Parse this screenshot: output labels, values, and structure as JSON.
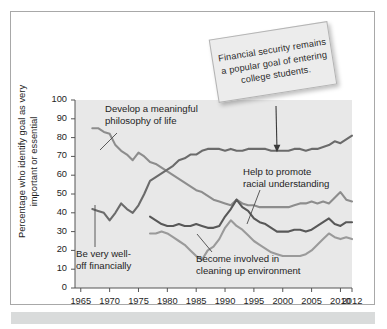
{
  "figure": {
    "background": "#ffffff",
    "frame_color": "#a8a8a8",
    "footer_bar_color": "#d9dbdb"
  },
  "callout": {
    "name": "financial-security-callout",
    "text": "Financial security remains a popular goal of entering college students.",
    "background": "#ececec",
    "border": "#b4b4b4",
    "rotation_deg": -9,
    "arrow_target_year": 1999,
    "arrow_target_value": 72
  },
  "annotations": [
    {
      "id": "philosophy",
      "text": "Develop a meaningful\nphilosophy of life"
    },
    {
      "id": "racial",
      "text": "Help to promote\nracial understanding"
    },
    {
      "id": "wealth",
      "text": "Be very well-\noff financially"
    },
    {
      "id": "environment",
      "text": "Become involved in\ncleaning up environment"
    }
  ],
  "chart_data": {
    "type": "line",
    "title": "",
    "xlabel": "",
    "ylabel": "Percentage who identify goal as very important or essential",
    "xlim": [
      1964,
      2012
    ],
    "ylim": [
      0,
      100
    ],
    "xticks": [
      1965,
      1970,
      1975,
      1980,
      1985,
      1990,
      1995,
      2000,
      2005,
      2010,
      2012
    ],
    "yticks": [
      0,
      10,
      20,
      30,
      40,
      50,
      60,
      70,
      80,
      90,
      100
    ],
    "grid": false,
    "legend": "none (inline annotations)",
    "plot_background": "#e8e8e8",
    "series": [
      {
        "name": "Develop a meaningful philosophy of life",
        "color": "#8d8d8d",
        "x": [
          1967,
          1968,
          1969,
          1970,
          1971,
          1972,
          1973,
          1974,
          1975,
          1976,
          1977,
          1978,
          1979,
          1980,
          1981,
          1982,
          1983,
          1984,
          1985,
          1986,
          1987,
          1988,
          1989,
          1990,
          1991,
          1992,
          1993,
          1994,
          1995,
          1996,
          1997,
          1998,
          1999,
          2000,
          2001,
          2002,
          2003,
          2004,
          2005,
          2006,
          2007,
          2008,
          2009,
          2010,
          2011,
          2012
        ],
        "y": [
          85,
          85,
          83,
          82,
          76,
          73,
          71,
          68,
          72,
          70,
          67,
          66,
          64,
          62,
          60,
          58,
          56,
          54,
          52,
          51,
          49,
          47,
          46,
          45,
          44,
          47,
          45,
          44,
          44,
          43,
          43,
          43,
          43,
          43,
          43,
          44,
          45,
          45,
          46,
          45,
          46,
          45,
          48,
          51,
          47,
          46
        ]
      },
      {
        "name": "Be very well-off financially",
        "color": "#6b6b6b",
        "x": [
          1967,
          1968,
          1969,
          1970,
          1971,
          1972,
          1973,
          1974,
          1975,
          1976,
          1977,
          1978,
          1979,
          1980,
          1981,
          1982,
          1983,
          1984,
          1985,
          1986,
          1987,
          1988,
          1989,
          1990,
          1991,
          1992,
          1993,
          1994,
          1995,
          1996,
          1997,
          1998,
          1999,
          2000,
          2001,
          2002,
          2003,
          2004,
          2005,
          2006,
          2007,
          2008,
          2009,
          2010,
          2011,
          2012
        ],
        "y": [
          42,
          41,
          40,
          36,
          40,
          45,
          42,
          40,
          44,
          50,
          57,
          59,
          61,
          63,
          65,
          68,
          69,
          71,
          71,
          73,
          74,
          74,
          74,
          73,
          74,
          73,
          73,
          74,
          74,
          74,
          74,
          73,
          73,
          73,
          73,
          74,
          74,
          73,
          74,
          74,
          75,
          76,
          78,
          77,
          79,
          81
        ]
      },
      {
        "name": "Help to promote racial understanding",
        "color": "#585858",
        "x": [
          1977,
          1978,
          1979,
          1980,
          1981,
          1982,
          1983,
          1984,
          1985,
          1986,
          1987,
          1988,
          1989,
          1990,
          1991,
          1992,
          1993,
          1994,
          1995,
          1996,
          1997,
          1998,
          1999,
          2000,
          2001,
          2002,
          2003,
          2004,
          2005,
          2006,
          2007,
          2008,
          2009,
          2010,
          2011,
          2012
        ],
        "y": [
          38,
          36,
          34,
          33,
          33,
          34,
          33,
          33,
          34,
          33,
          32,
          32,
          33,
          38,
          42,
          47,
          43,
          41,
          37,
          35,
          34,
          32,
          30,
          30,
          30,
          31,
          31,
          30,
          31,
          33,
          35,
          37,
          34,
          33,
          35,
          35
        ]
      },
      {
        "name": "Become involved in cleaning up environment",
        "color": "#9a9a9a",
        "x": [
          1977,
          1978,
          1979,
          1980,
          1981,
          1982,
          1983,
          1984,
          1985,
          1986,
          1987,
          1988,
          1989,
          1990,
          1991,
          1992,
          1993,
          1994,
          1995,
          1996,
          1997,
          1998,
          1999,
          2000,
          2001,
          2002,
          2003,
          2004,
          2005,
          2006,
          2007,
          2008,
          2009,
          2010,
          2011,
          2012
        ],
        "y": [
          29,
          29,
          30,
          29,
          27,
          25,
          23,
          20,
          17,
          15,
          20,
          22,
          26,
          32,
          36,
          33,
          31,
          28,
          25,
          23,
          21,
          19,
          18,
          17,
          17,
          17,
          17,
          18,
          20,
          23,
          26,
          29,
          27,
          26,
          27,
          26
        ]
      }
    ]
  }
}
